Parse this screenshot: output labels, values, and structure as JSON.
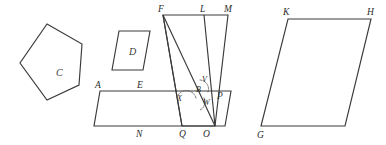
{
  "figure": {
    "type": "geometry-diagram",
    "background_color": "#ffffff",
    "stroke_color": "#3a3a3a",
    "arc_color": "#555555",
    "canvas": {
      "width": 386,
      "height": 145
    }
  },
  "shapes": {
    "pentagon_c": {
      "label": "C",
      "label_x": 56,
      "label_y": 76,
      "points": "47,24 82,44 79,85 47,100 20,63"
    },
    "parallelogram_d": {
      "label": "D",
      "label_x": 129,
      "label_y": 55,
      "points": "119,31 150,31 143,70 112,70"
    },
    "parallelogram_aenp": {
      "points": "100,91 231,91 225,126 94,126"
    },
    "composite_flmo": {
      "outline": "163,15 228,15 215,126 182,126",
      "segment_fq": "163,15 182,126",
      "segment_fo": "163,15 215,126",
      "segment_lo": "204,15 215,126",
      "segment_mo_right": "228,15 215,126"
    },
    "parallelogram_kghg": {
      "points": "288,19 371,19 345,126 261,126"
    }
  },
  "arcs": {
    "angle_b_upper": "M 200,80 A 9 9 0 0 1 208,92",
    "angle_x_left": "M 178,95 A 10 10 0 0 1 196,98",
    "angle_w_lower": "M 204,98 A 9 9 0 0 1 200,110"
  },
  "labels": {
    "vertices": [
      {
        "name": "F",
        "text": "F",
        "x": 158,
        "y": 12
      },
      {
        "name": "L",
        "text": "L",
        "x": 200,
        "y": 12
      },
      {
        "name": "M",
        "text": "M",
        "x": 224,
        "y": 12
      },
      {
        "name": "K",
        "text": "K",
        "x": 283,
        "y": 15
      },
      {
        "name": "H",
        "text": "H",
        "x": 367,
        "y": 15
      },
      {
        "name": "A",
        "text": "A",
        "x": 95,
        "y": 88
      },
      {
        "name": "E",
        "text": "E",
        "x": 137,
        "y": 88
      },
      {
        "name": "P",
        "text": "P",
        "x": 217,
        "y": 99
      },
      {
        "name": "V",
        "text": "V",
        "x": 202,
        "y": 82
      },
      {
        "name": "B",
        "text": "B",
        "x": 196,
        "y": 92
      },
      {
        "name": "X",
        "text": "X",
        "x": 177,
        "y": 101
      },
      {
        "name": "W",
        "text": "W",
        "x": 203,
        "y": 105
      },
      {
        "name": "N",
        "text": "N",
        "x": 136,
        "y": 137
      },
      {
        "name": "Q",
        "text": "Q",
        "x": 179,
        "y": 137
      },
      {
        "name": "O",
        "text": "O",
        "x": 203,
        "y": 137
      },
      {
        "name": "G",
        "text": "G",
        "x": 257,
        "y": 138
      }
    ]
  }
}
